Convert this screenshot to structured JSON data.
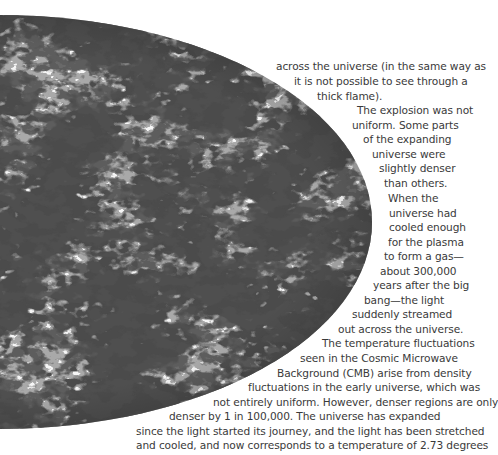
{
  "figure": {
    "name": "Cosmic Microwave Background sky map",
    "colors": {
      "base": "#a9a9a9",
      "dark": "#151515",
      "light": "#e6e6e6",
      "text": "#3a3a3a"
    }
  },
  "body_text": {
    "lines": [
      {
        "text": "across the universe (in the same way as",
        "x": 276,
        "y": 59
      },
      {
        "text": "it is not possible to see through a",
        "x": 294,
        "y": 74
      },
      {
        "text": "thick flame).",
        "x": 317,
        "y": 89
      },
      {
        "text": "The explosion was not",
        "x": 357,
        "y": 103
      },
      {
        "text": "uniform. Some parts",
        "x": 352,
        "y": 118
      },
      {
        "text": "of the expanding",
        "x": 363,
        "y": 132
      },
      {
        "text": "universe were",
        "x": 372,
        "y": 147
      },
      {
        "text": "slightly denser",
        "x": 379,
        "y": 161
      },
      {
        "text": "than others.",
        "x": 384,
        "y": 176
      },
      {
        "text": "When the",
        "x": 388,
        "y": 191
      },
      {
        "text": "universe had",
        "x": 389,
        "y": 206
      },
      {
        "text": "cooled enough",
        "x": 389,
        "y": 220
      },
      {
        "text": "for the plasma",
        "x": 388,
        "y": 235
      },
      {
        "text": "to form a gas—",
        "x": 384,
        "y": 249
      },
      {
        "text": "about 300,000",
        "x": 380,
        "y": 264
      },
      {
        "text": "years after the big",
        "x": 373,
        "y": 278
      },
      {
        "text": "bang—the light",
        "x": 364,
        "y": 293
      },
      {
        "text": "suddenly streamed",
        "x": 352,
        "y": 307
      },
      {
        "text": "out across the universe.",
        "x": 338,
        "y": 322
      },
      {
        "text": "The temperature fluctuations",
        "x": 322,
        "y": 336
      },
      {
        "text": "seen in the Cosmic Microwave",
        "x": 300,
        "y": 351
      },
      {
        "text": "Background (CMB) arise from density",
        "x": 277,
        "y": 366
      },
      {
        "text": "fluctuations in the early universe, which was",
        "x": 248,
        "y": 380
      },
      {
        "text": "not entirely uniform. However, denser regions are only",
        "x": 213,
        "y": 395
      },
      {
        "text": "denser by 1 in 100,000. The universe has expanded",
        "x": 169,
        "y": 409
      },
      {
        "text": "since the light started its journey, and the light has been stretched",
        "x": 136,
        "y": 424
      },
      {
        "text": "and cooled, and now corresponds to a temperature of 2.73 degrees",
        "x": 136,
        "y": 438
      }
    ]
  }
}
